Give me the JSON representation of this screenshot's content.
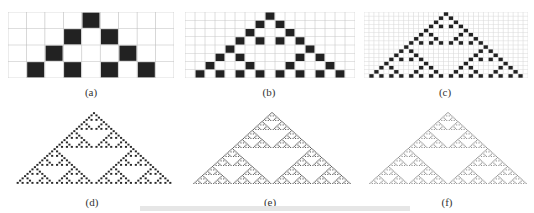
{
  "figure": {
    "rule": 90,
    "panels": [
      {
        "id": "a",
        "label": "(a)",
        "rows": 4,
        "cols": 9,
        "grid": true,
        "x": 8,
        "y": 12,
        "w": 166,
        "h": 66,
        "cap_x": 91,
        "cap_y": 86,
        "cell_color": "#222222",
        "grid_color": "#bdbdbd",
        "gap": 0.08
      },
      {
        "id": "b",
        "label": "(b)",
        "rows": 8,
        "cols": 17,
        "grid": true,
        "x": 185,
        "y": 12,
        "w": 170,
        "h": 66,
        "cap_x": 269,
        "cap_y": 86,
        "cell_color": "#222222",
        "grid_color": "#c8c8c8",
        "gap": 0.12
      },
      {
        "id": "c",
        "label": "(c)",
        "rows": 16,
        "cols": 33,
        "grid": true,
        "x": 364,
        "y": 12,
        "w": 164,
        "h": 66,
        "cap_x": 445,
        "cap_y": 86,
        "cell_color": "#222222",
        "grid_color": "#dadada",
        "gap": 0.15
      },
      {
        "id": "d",
        "label": "(d)",
        "rows": 32,
        "cols": 65,
        "grid": false,
        "x": 14,
        "y": 112,
        "w": 160,
        "h": 72,
        "cap_x": 92,
        "cap_y": 196,
        "cell_color": "#2a2a2a",
        "grid_color": "#f0f0f0",
        "gap": 0.15
      },
      {
        "id": "e",
        "label": "(e)",
        "rows": 64,
        "cols": 129,
        "grid": false,
        "x": 192,
        "y": 112,
        "w": 160,
        "h": 72,
        "cap_x": 270,
        "cap_y": 196,
        "cell_color": "#555555",
        "grid_color": "#ffffff",
        "gap": 0.1
      },
      {
        "id": "f",
        "label": "(f)",
        "rows": 64,
        "cols": 129,
        "grid": false,
        "x": 368,
        "y": 112,
        "w": 160,
        "h": 72,
        "cap_x": 447,
        "cap_y": 196,
        "cell_color": "#8a8a8a",
        "grid_color": "#ffffff",
        "gap": 0.1
      }
    ]
  }
}
